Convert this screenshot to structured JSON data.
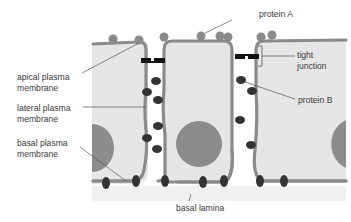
{
  "labels": {
    "apical": "apical plasma\nmembrane",
    "lateral": "lateral plasma\nmembrane",
    "basal": "basal plasma\nmembrane",
    "protein_a": "protein A",
    "tight_junction": "tight\njunction",
    "protein_b": "protein B",
    "basal_lamina": "basal lamina"
  },
  "colors": {
    "cytoplasm": "#e6e6e6",
    "membrane": "#8a8a8a",
    "protein_a": "#8a8a8a",
    "protein_b": "#333333",
    "nucleus": "#8c8c8c",
    "junction": "#111111",
    "lamina": "#f0f0f0",
    "leader": "#555555",
    "text": "#3a3a3a"
  }
}
